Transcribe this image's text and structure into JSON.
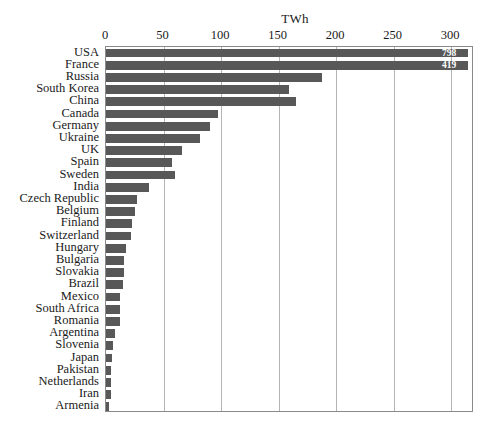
{
  "chart_data": {
    "type": "bar",
    "orientation": "horizontal",
    "title": "",
    "xlabel": "TWh",
    "ylabel": "",
    "axis_title": "TWh",
    "xlim": [
      0,
      320
    ],
    "xticks": [
      0,
      50,
      100,
      150,
      200,
      250,
      300
    ],
    "xtick_labels": [
      "0",
      "50",
      "100",
      "150",
      "200",
      "250",
      "300"
    ],
    "grid": true,
    "grid_axis": "x",
    "legend": false,
    "bar_color": "#585858",
    "plot_border_color": "#8a8a8a",
    "gridline_color": "#b4b4b4",
    "value_label_color": "#ffffff",
    "note": "Bars for USA and France exceed the axis maximum and are clipped at the plot edge with their values printed inside.",
    "categories": [
      "USA",
      "France",
      "Russia",
      "South Korea",
      "China",
      "Canada",
      "Germany",
      "Ukraine",
      "UK",
      "Spain",
      "Sweden",
      "India",
      "Czech Republic",
      "Belgium",
      "Finland",
      "Switzerland",
      "Hungary",
      "Bulgaria",
      "Slovakia",
      "Brazil",
      "Mexico",
      "South Africa",
      "Romania",
      "Argentina",
      "Slovenia",
      "Japan",
      "Pakistan",
      "Netherlands",
      "Iran",
      "Armenia"
    ],
    "values": [
      798,
      419,
      188,
      159,
      165,
      97,
      90,
      82,
      66,
      57,
      60,
      37,
      27,
      25,
      23,
      22,
      17,
      16,
      16,
      15,
      12,
      12,
      12,
      8,
      6,
      5,
      4,
      4,
      4,
      3
    ],
    "value_labels": [
      "798",
      "419",
      "",
      "",
      "",
      "",
      "",
      "",
      "",
      "",
      "",
      "",
      "",
      "",
      "",
      "",
      "",
      "",
      "",
      "",
      "",
      "",
      "",
      "",
      "",
      "",
      "",
      "",
      "",
      ""
    ]
  }
}
